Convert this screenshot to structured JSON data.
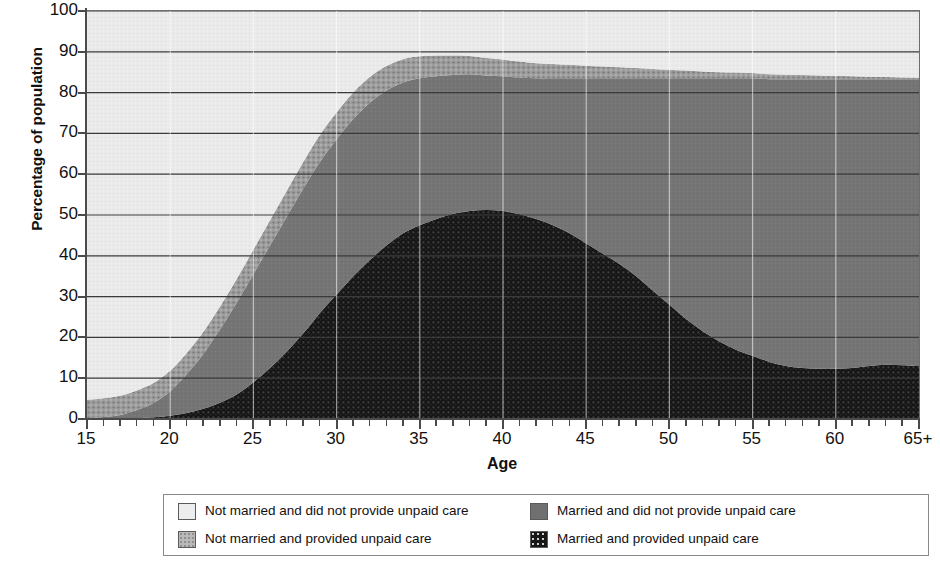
{
  "chart_data": {
    "type": "area",
    "stacked": true,
    "title": "",
    "xlabel": "Age",
    "ylabel": "Percentage of population",
    "xlim": [
      15,
      65
    ],
    "ylim": [
      0,
      100
    ],
    "grid": "horizontal",
    "legend_position": "bottom",
    "x_tick_labels": [
      "15",
      "20",
      "25",
      "30",
      "35",
      "40",
      "45",
      "50",
      "55",
      "60",
      "65+"
    ],
    "x_tick_values": [
      15,
      20,
      25,
      30,
      35,
      40,
      45,
      50,
      55,
      60,
      65
    ],
    "x_minor_tick_step": 1,
    "y_tick_labels": [
      "0",
      "10",
      "20",
      "30",
      "40",
      "50",
      "60",
      "70",
      "80",
      "90",
      "100"
    ],
    "y_tick_values": [
      0,
      10,
      20,
      30,
      40,
      50,
      60,
      70,
      80,
      90,
      100
    ],
    "x": [
      15,
      16,
      17,
      18,
      19,
      20,
      21,
      22,
      23,
      24,
      25,
      26,
      27,
      28,
      29,
      30,
      31,
      32,
      33,
      34,
      35,
      36,
      37,
      38,
      39,
      40,
      41,
      42,
      43,
      44,
      45,
      46,
      47,
      48,
      49,
      50,
      51,
      52,
      53,
      54,
      55,
      56,
      57,
      58,
      59,
      60,
      61,
      62,
      63,
      64,
      65
    ],
    "series": [
      {
        "name": "Married and provided unpaid care",
        "color": "#1a1a1a",
        "pattern": "dotted-dark",
        "stack_order": 1,
        "values": [
          0,
          0,
          0,
          0.2,
          0.4,
          0.8,
          1.5,
          2.5,
          4,
          6,
          9,
          12.5,
          16.5,
          21,
          26,
          30.5,
          35,
          39,
          42.5,
          45.5,
          47.5,
          49,
          50.3,
          51,
          51.2,
          51,
          50.2,
          49,
          47.5,
          45.5,
          43,
          40.5,
          38,
          35,
          31.5,
          28,
          24.5,
          21.5,
          19,
          17,
          15.5,
          14,
          13,
          12.5,
          12.3,
          12.3,
          12.5,
          13,
          13.3,
          13.2,
          13
        ]
      },
      {
        "name": "Married and did not provide unpaid care",
        "color": "#757575",
        "pattern": "solid-gray",
        "stack_order": 2,
        "values": [
          0.2,
          0.5,
          1,
          2,
          3.5,
          6,
          9.5,
          13.5,
          18,
          22.5,
          26.5,
          30,
          33,
          35.5,
          37,
          38,
          38.5,
          38.5,
          38,
          37,
          36,
          35,
          34,
          33.5,
          33,
          33,
          33.5,
          34.5,
          36,
          38,
          40.5,
          43,
          45.5,
          48.5,
          52,
          55.5,
          59,
          62,
          64.5,
          66.5,
          68,
          69.3,
          70.3,
          70.8,
          71,
          71,
          70.8,
          70.3,
          70,
          70.1,
          70.3
        ]
      },
      {
        "name": "Not married and provided unpaid care",
        "color": "#8f8f8f",
        "pattern": "dotted-mid",
        "stack_order": 3,
        "values": [
          4.5,
          4.6,
          4.7,
          4.8,
          4.9,
          5,
          5.2,
          5.4,
          5.6,
          5.8,
          6,
          6.2,
          6.4,
          6.5,
          6.6,
          6.6,
          6.5,
          6.3,
          6,
          5.7,
          5.4,
          5.1,
          4.8,
          4.5,
          4.3,
          4.1,
          3.9,
          3.7,
          3.5,
          3.3,
          3.1,
          2.9,
          2.7,
          2.5,
          2.3,
          2.1,
          1.9,
          1.7,
          1.5,
          1.4,
          1.3,
          1.2,
          1.1,
          1,
          0.9,
          0.8,
          0.7,
          0.6,
          0.5,
          0.4,
          0.3
        ]
      },
      {
        "name": "Not married and did not provide unpaid care",
        "color": "#eaeaea",
        "pattern": "light-noise",
        "stack_order": 4,
        "values": [
          95.3,
          94.9,
          94.3,
          93,
          91.2,
          88.2,
          83.8,
          78.6,
          72.4,
          65.7,
          58.5,
          51.3,
          44.1,
          37,
          30.4,
          24.9,
          20,
          16.2,
          13.5,
          11.8,
          11.1,
          10.9,
          10.9,
          11,
          11.5,
          11.9,
          12.4,
          12.8,
          13,
          13.2,
          13.4,
          13.6,
          13.8,
          14,
          14.2,
          14.4,
          14.6,
          14.8,
          15,
          15.1,
          15.2,
          15.5,
          15.6,
          15.7,
          15.8,
          15.9,
          16,
          16.1,
          16.2,
          16.3,
          16.4
        ]
      }
    ],
    "totals_excluding_light": [
      4.7,
      5.1,
      5.7,
      7.0,
      8.8,
      11.8,
      16.2,
      21.4,
      27.6,
      34.3,
      41.5,
      48.7,
      55.9,
      63.0,
      69.6,
      75.1,
      80.0,
      83.8,
      86.5,
      88.2,
      88.9,
      89.1,
      89.1,
      89.0,
      88.5,
      88.1,
      87.6,
      87.2,
      87.0,
      86.8,
      86.6,
      86.4,
      86.2,
      86.0,
      85.8,
      85.6,
      85.4,
      85.2,
      85.0,
      84.9,
      84.8,
      84.5,
      84.4,
      84.3,
      84.2,
      84.1,
      84.0,
      83.9,
      83.8,
      83.7,
      83.6
    ]
  },
  "axes": {
    "y_title": "Percentage of population",
    "x_title": "Age",
    "y_ticks": [
      "100",
      "90",
      "80",
      "70",
      "60",
      "50",
      "40",
      "30",
      "20",
      "10",
      "0"
    ],
    "x_ticks": [
      "15",
      "20",
      "25",
      "30",
      "35",
      "40",
      "45",
      "50",
      "55",
      "60",
      "65+"
    ]
  },
  "legend": {
    "items": [
      {
        "label": "Not married and did not provide unpaid care",
        "swatch": "lightest"
      },
      {
        "label": "Married and did not provide unpaid care",
        "swatch": "midgray"
      },
      {
        "label": "Not married and provided unpaid care",
        "swatch": "lightmid"
      },
      {
        "label": "Married and provided unpaid care",
        "swatch": "dark"
      }
    ]
  }
}
